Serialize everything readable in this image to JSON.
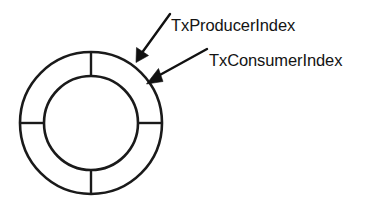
{
  "figure": {
    "kind": "ring-buffer-diagram",
    "background_color": "#ffffff",
    "stroke_color": "#1a1a1a",
    "text_color": "#141414"
  },
  "ring": {
    "name": "circular-buffer-ring",
    "center_x": 91,
    "center_y": 123,
    "outer_radius": 71,
    "inner_radius": 47,
    "stroke_width": 2.6,
    "segment_count": 4,
    "spoke_angles_deg": [
      0,
      90,
      180,
      270
    ]
  },
  "callouts": [
    {
      "id": "producer",
      "label": "TxProducerIndex",
      "target_x": 136,
      "target_y": 62,
      "tail_x": 170,
      "tail_y": 14
    },
    {
      "id": "consumer",
      "label": "TxConsumerIndex",
      "target_x": 147,
      "target_y": 84,
      "tail_x": 207,
      "tail_y": 49
    }
  ]
}
